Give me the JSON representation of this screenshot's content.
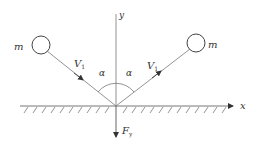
{
  "diagram": {
    "title": "",
    "axes": {
      "x_label": "x",
      "y_label": "y"
    },
    "masses": [
      {
        "label": "m",
        "side": "left"
      },
      {
        "label": "m",
        "side": "right"
      }
    ],
    "velocities": [
      {
        "label": "V",
        "subscript": "1",
        "direction": "incoming"
      },
      {
        "label": "V",
        "subscript": "1",
        "direction": "outgoing"
      }
    ],
    "angles": [
      {
        "label": "α"
      },
      {
        "label": "α"
      }
    ],
    "force": {
      "label": "F",
      "subscript": "y"
    },
    "colors": {
      "line": "#666666",
      "text": "#333333",
      "background": "#ffffff"
    }
  }
}
